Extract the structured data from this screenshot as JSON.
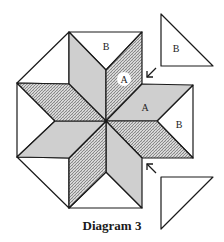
{
  "diagram": {
    "caption": "Diagram 3",
    "colors": {
      "gray": "#cfcfcf",
      "white": "#ffffff",
      "hatch_bg": "#d4d4d4",
      "hatch_line": "#555555",
      "stroke": "#1a1a1a"
    },
    "labels": {
      "top_triangle": "B",
      "circled_diamond": "A",
      "right_diamond": "A",
      "right_triangle": "B",
      "floating_top_triangle": "B"
    },
    "arrows": [
      {
        "name": "arrow-top-notch",
        "direction": "down-left"
      },
      {
        "name": "arrow-bottom-notch",
        "direction": "up-left"
      }
    ],
    "floating_pieces": [
      {
        "name": "loose-triangle-top",
        "label": "B"
      },
      {
        "name": "loose-triangle-bottom",
        "label": ""
      }
    ]
  }
}
